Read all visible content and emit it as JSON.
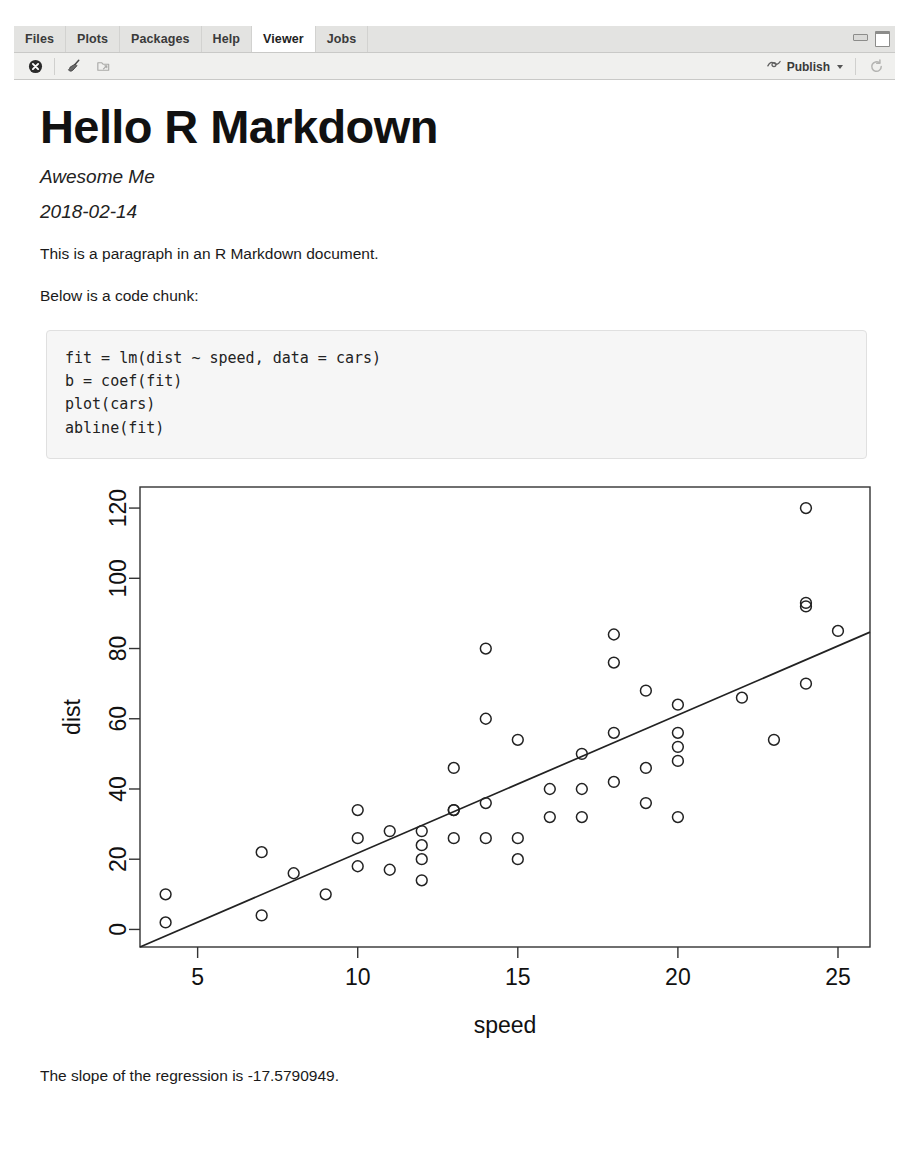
{
  "window": {
    "minimize_icon": "minimize-window-icon",
    "maximize_icon": "maximize-window-icon"
  },
  "tabs": [
    {
      "label": "Files",
      "active": false
    },
    {
      "label": "Plots",
      "active": false
    },
    {
      "label": "Packages",
      "active": false
    },
    {
      "label": "Help",
      "active": false
    },
    {
      "label": "Viewer",
      "active": true
    },
    {
      "label": "Jobs",
      "active": false
    }
  ],
  "toolbar": {
    "stop_icon": "stop-circle-icon",
    "clear_icon": "broom-clear-icon",
    "export_icon": "export-save-icon",
    "publish_label": "Publish",
    "publish_icon": "publish-icon",
    "refresh_icon": "refresh-icon"
  },
  "document": {
    "title": "Hello R Markdown",
    "author": "Awesome Me",
    "date": "2018-02-14",
    "paragraph_1": "This is a paragraph in an R Markdown document.",
    "paragraph_2": "Below is a code chunk:",
    "code": "fit = lm(dist ~ speed, data = cars)\nb = coef(fit)\nplot(cars)\nabline(fit)",
    "closing": "The slope of the regression is -17.5790949."
  },
  "chart_data": {
    "type": "scatter",
    "title": "",
    "xlabel": "speed",
    "ylabel": "dist",
    "xlim": [
      3.2,
      26.0
    ],
    "ylim": [
      -5,
      126
    ],
    "xticks": [
      5,
      10,
      15,
      20,
      25
    ],
    "yticks": [
      0,
      20,
      40,
      60,
      80,
      100,
      120
    ],
    "grid": false,
    "legend": "none",
    "point_marker": "open-circle",
    "x": [
      4,
      4,
      7,
      7,
      8,
      9,
      10,
      10,
      10,
      11,
      11,
      12,
      12,
      12,
      12,
      13,
      13,
      13,
      13,
      14,
      14,
      14,
      14,
      15,
      15,
      15,
      16,
      16,
      17,
      17,
      17,
      18,
      18,
      18,
      18,
      19,
      19,
      19,
      20,
      20,
      20,
      20,
      20,
      22,
      23,
      24,
      24,
      24,
      24,
      25
    ],
    "y": [
      2,
      10,
      4,
      22,
      16,
      10,
      18,
      26,
      34,
      17,
      28,
      14,
      20,
      24,
      28,
      26,
      34,
      34,
      46,
      26,
      36,
      60,
      80,
      20,
      26,
      54,
      32,
      40,
      32,
      40,
      50,
      42,
      56,
      76,
      84,
      36,
      46,
      68,
      32,
      48,
      52,
      56,
      64,
      66,
      54,
      70,
      92,
      93,
      120,
      85
    ],
    "regression_line": {
      "intercept": -17.5790949,
      "slope": 3.9324088,
      "label": "abline(fit)"
    }
  }
}
